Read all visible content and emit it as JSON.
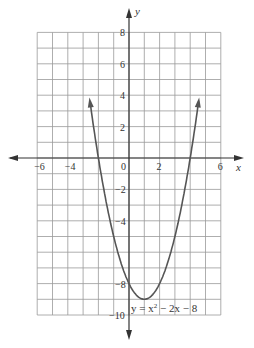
{
  "chart_data": {
    "type": "line",
    "title": "",
    "xlabel": "x",
    "ylabel": "y",
    "xlim": [
      -6,
      6
    ],
    "ylim": [
      -10,
      8
    ],
    "grid": true,
    "x_ticks": [
      -6,
      -4,
      0,
      2,
      6
    ],
    "y_ticks": [
      8,
      6,
      4,
      2,
      -2,
      -4,
      -8,
      -10
    ],
    "origin_label": "0",
    "annotation": "y = x² − 2x − 8",
    "series": [
      {
        "name": "y = x^2 - 2x - 8",
        "equation": "y = x^2 - 2x - 8",
        "vertex": [
          1,
          -9
        ],
        "x_intercepts": [
          -2,
          4
        ],
        "y_intercept": -8,
        "x": [
          -2.6,
          -2,
          -1,
          0,
          1,
          2,
          3,
          4,
          4.6
        ],
        "y": [
          4.0,
          0,
          -5,
          -8,
          -9,
          -8,
          -5,
          0,
          4.0
        ]
      }
    ],
    "colors": {
      "curve": "#555555",
      "grid": "#999999",
      "axis": "#333333"
    }
  },
  "labels": {
    "x_axis": "x",
    "y_axis": "y",
    "origin": "0",
    "equation_prefix": "y = x",
    "equation_sup": "2",
    "equation_suffix": " − 2x − 8"
  }
}
